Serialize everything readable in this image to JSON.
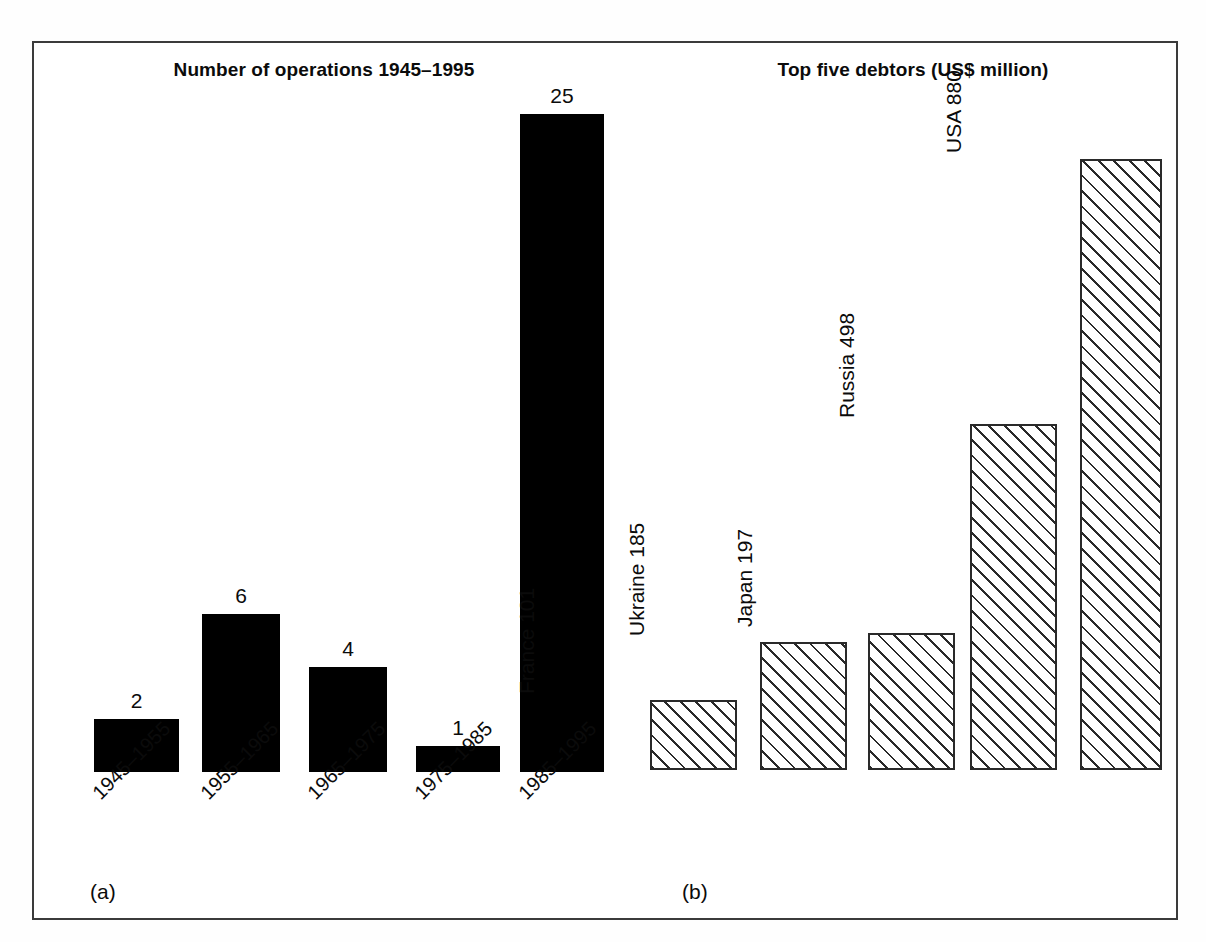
{
  "figure": {
    "panels": [
      {
        "tag": "(a)",
        "title": "Number of operations 1945–1995"
      },
      {
        "tag": "(b)",
        "title": "Top five debtors (US$ million)"
      }
    ]
  },
  "chart_data": [
    {
      "type": "bar",
      "panel": "(a)",
      "title": "Number of operations 1945–1995",
      "xlabel": "",
      "ylabel": "",
      "categories": [
        "1945–1955",
        "1955–1965",
        "1965–1975",
        "1975–1985",
        "1985–1995"
      ],
      "values": [
        2,
        6,
        4,
        1,
        25
      ],
      "data_labels": [
        "2",
        "6",
        "4",
        "1",
        "25"
      ],
      "ylim": [
        0,
        25
      ],
      "grid": false,
      "legend": "none",
      "bar_style": "solid-black",
      "tick_label_rotation": -45
    },
    {
      "type": "bar",
      "panel": "(b)",
      "title": "Top five debtors (US$ million)",
      "xlabel": "",
      "ylabel": "",
      "categories": [
        "France",
        "Ukraine",
        "Japan",
        "Russia",
        "USA"
      ],
      "values": [
        101,
        185,
        197,
        498,
        880
      ],
      "data_labels": [
        "France 101",
        "Ukraine 185",
        "Japan 197",
        "Russia 498",
        "USA 880"
      ],
      "ylim": [
        0,
        880
      ],
      "grid": false,
      "legend": "none",
      "bar_style": "diagonal-hatch",
      "tick_label_rotation": -90
    }
  ],
  "colors": {
    "bar_fill_a": "#000000",
    "bar_outline_b": "#2a2a2a",
    "bar_fill_b": "#ffffff",
    "frame": "#3b3b3b",
    "text": "#0b0b0b",
    "background": "#ffffff"
  }
}
